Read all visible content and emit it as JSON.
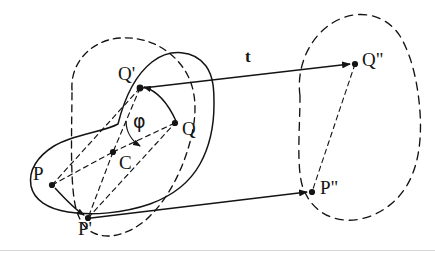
{
  "figure": {
    "type": "geometry-diagram",
    "background_color": "#ffffff",
    "stroke_color": "#141414",
    "width": 435,
    "height": 258
  },
  "labels": {
    "p": "P",
    "p_prime": "P'",
    "p_double_prime": "P\"",
    "q": "Q",
    "q_prime": "Q'",
    "q_double_prime": "Q\"",
    "c": "C",
    "phi": "φ",
    "t": "t"
  },
  "points": [
    {
      "name": "P",
      "x": 52,
      "y": 185
    },
    {
      "name": "P'",
      "x": 88,
      "y": 218
    },
    {
      "name": "P\"",
      "x": 312,
      "y": 192
    },
    {
      "name": "Q",
      "x": 175,
      "y": 123
    },
    {
      "name": "Q'",
      "x": 140,
      "y": 88
    },
    {
      "name": "Q\"",
      "x": 355,
      "y": 64
    },
    {
      "name": "C",
      "x": 113,
      "y": 152
    }
  ],
  "vectors": [
    {
      "name": "t-upper",
      "from": "Q'",
      "to": "Q\"",
      "label": "t",
      "style": "solid-arrow"
    },
    {
      "name": "t-lower",
      "from": "P'",
      "to": "P\"",
      "label": "",
      "style": "solid-arrow"
    },
    {
      "name": "rotation-P",
      "from": "P",
      "to": "P'",
      "style": "curved-arrow"
    },
    {
      "name": "rotation-Q",
      "from": "Q",
      "to": "Q'",
      "style": "curved-arrow"
    }
  ],
  "angle": {
    "name": "phi",
    "vertex": "C",
    "from_ray": "C-Q'",
    "to_ray": "C-Q",
    "label": "φ"
  },
  "regions": [
    {
      "name": "original-body",
      "style": "solid",
      "contains": [
        "P",
        "Q",
        "C"
      ]
    },
    {
      "name": "rotated-body",
      "style": "dashed",
      "contains": [
        "P'",
        "Q'"
      ]
    },
    {
      "name": "translated-body",
      "style": "dashed",
      "contains": [
        "P\"",
        "Q\""
      ]
    }
  ]
}
